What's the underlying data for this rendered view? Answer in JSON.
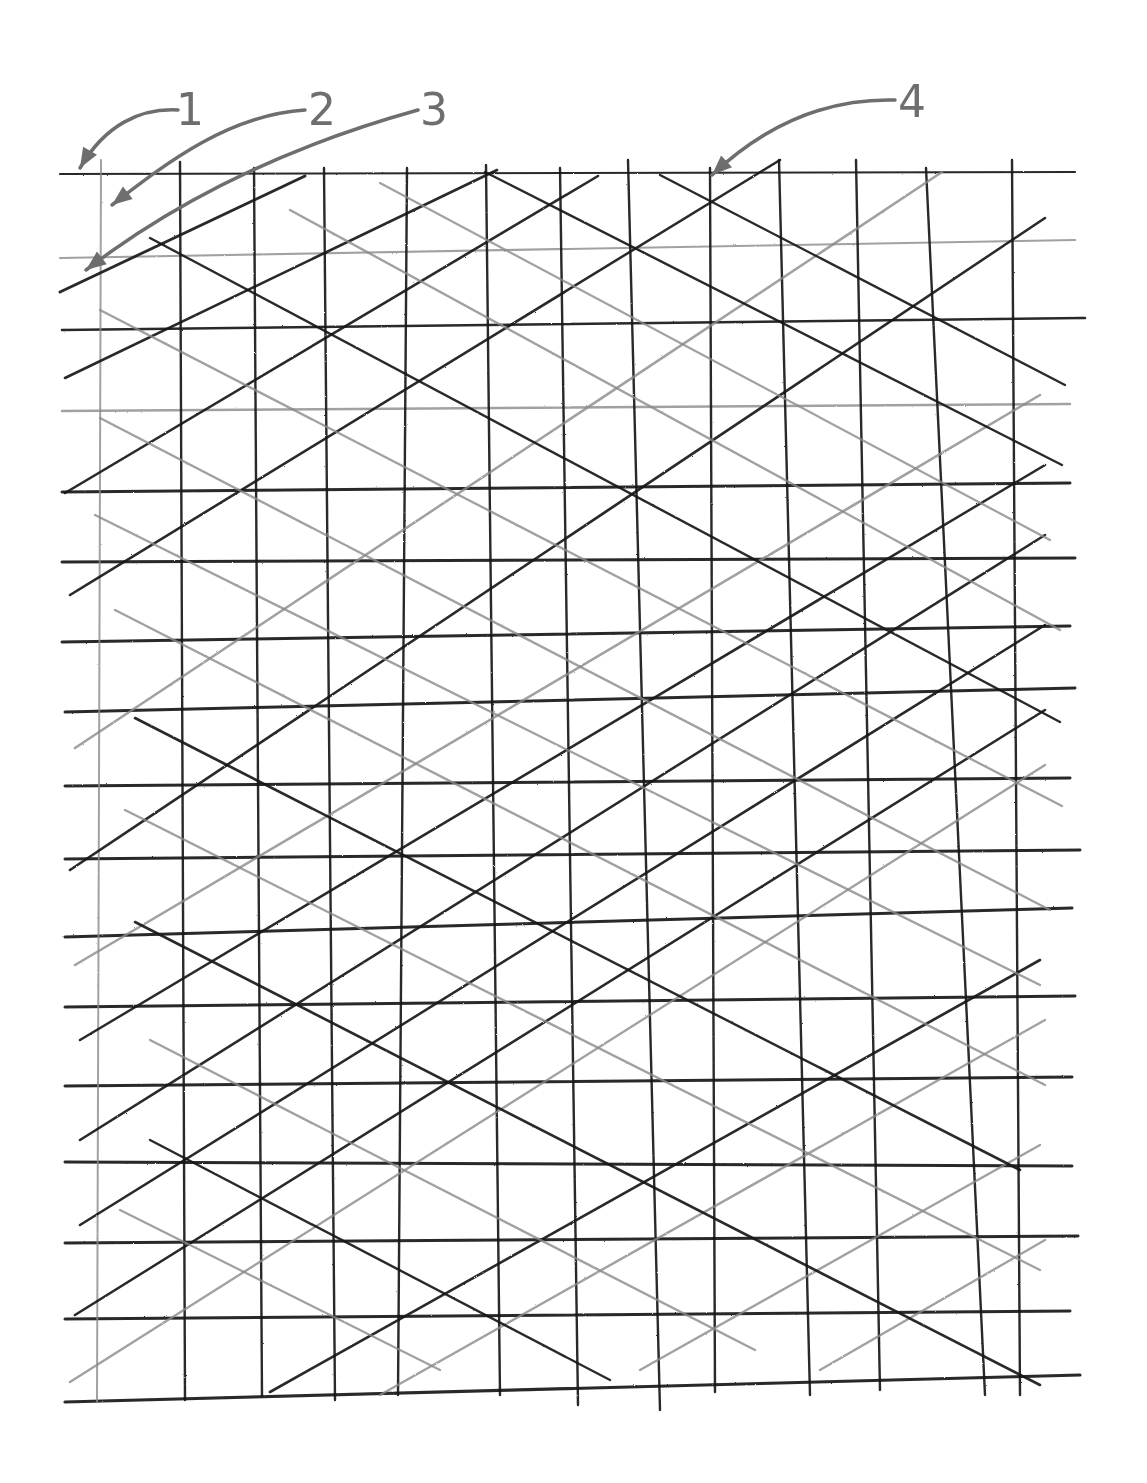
{
  "figure": {
    "type": "patent-style hand-drawn lattice / mesh diagram",
    "background": "#ffffff",
    "ink_dark": "#161616",
    "ink_gray": "#8a8a8a",
    "callout_color": "#6e6e6e"
  },
  "callouts": [
    {
      "id": "1",
      "label": "1",
      "label_x": 183,
      "label_y": 88,
      "path": "M178,110 C140,108 105,125 80,168",
      "tip": [
        76,
        172
      ]
    },
    {
      "id": "2",
      "label": "2",
      "label_x": 318,
      "label_y": 88,
      "path": "M305,110 C230,115 170,160 112,205",
      "tip": [
        106,
        210
      ]
    },
    {
      "id": "3",
      "label": "3",
      "label_x": 428,
      "label_y": 88,
      "path": "M418,110 C310,140 190,190 86,270",
      "tip": [
        80,
        276
      ]
    },
    {
      "id": "4",
      "label": "4",
      "label_x": 905,
      "label_y": 78,
      "path": "M895,100 C820,98 760,130 712,175",
      "tip": [
        708,
        180
      ]
    }
  ],
  "horizontal_lines": [
    {
      "y1": 174,
      "y2": 172,
      "x1": 60,
      "x2": 1075,
      "tone": "dark",
      "w": 2.2
    },
    {
      "y1": 258,
      "y2": 240,
      "x1": 60,
      "x2": 1075,
      "tone": "gray",
      "w": 2.2
    },
    {
      "y1": 330,
      "y2": 318,
      "x1": 62,
      "x2": 1085,
      "tone": "dark",
      "w": 2.6
    },
    {
      "y1": 411,
      "y2": 404,
      "x1": 62,
      "x2": 1070,
      "tone": "gray",
      "w": 2.4
    },
    {
      "y1": 492,
      "y2": 483,
      "x1": 62,
      "x2": 1070,
      "tone": "dark",
      "w": 3
    },
    {
      "y1": 562,
      "y2": 558,
      "x1": 62,
      "x2": 1075,
      "tone": "dark",
      "w": 3
    },
    {
      "y1": 642,
      "y2": 626,
      "x1": 62,
      "x2": 1070,
      "tone": "dark",
      "w": 3
    },
    {
      "y1": 712,
      "y2": 688,
      "x1": 65,
      "x2": 1075,
      "tone": "dark",
      "w": 3
    },
    {
      "y1": 786,
      "y2": 778,
      "x1": 65,
      "x2": 1070,
      "tone": "dark",
      "w": 3
    },
    {
      "y1": 859,
      "y2": 850,
      "x1": 65,
      "x2": 1080,
      "tone": "dark",
      "w": 3
    },
    {
      "y1": 937,
      "y2": 908,
      "x1": 65,
      "x2": 1072,
      "tone": "dark",
      "w": 3
    },
    {
      "y1": 1007,
      "y2": 996,
      "x1": 65,
      "x2": 1075,
      "tone": "dark",
      "w": 3
    },
    {
      "y1": 1086,
      "y2": 1077,
      "x1": 65,
      "x2": 1072,
      "tone": "dark",
      "w": 3
    },
    {
      "y1": 1162,
      "y2": 1166,
      "x1": 65,
      "x2": 1072,
      "tone": "dark",
      "w": 3
    },
    {
      "y1": 1243,
      "y2": 1236,
      "x1": 65,
      "x2": 1078,
      "tone": "dark",
      "w": 3
    },
    {
      "y1": 1319,
      "y2": 1311,
      "x1": 65,
      "x2": 1070,
      "tone": "dark",
      "w": 3
    },
    {
      "y1": 1402,
      "y2": 1375,
      "x1": 65,
      "x2": 1080,
      "tone": "dark",
      "w": 3.2
    }
  ],
  "vertical_lines": [
    {
      "x1": 101,
      "x2": 97,
      "y1": 160,
      "y2": 1402,
      "tone": "gray",
      "w": 2
    },
    {
      "x1": 180,
      "x2": 185,
      "y1": 162,
      "y2": 1400,
      "tone": "dark",
      "w": 2.4
    },
    {
      "x1": 254,
      "x2": 262,
      "y1": 168,
      "y2": 1396,
      "tone": "dark",
      "w": 2.4
    },
    {
      "x1": 324,
      "x2": 335,
      "y1": 168,
      "y2": 1400,
      "tone": "dark",
      "w": 2.4
    },
    {
      "x1": 407,
      "x2": 398,
      "y1": 168,
      "y2": 1395,
      "tone": "dark",
      "w": 2.4
    },
    {
      "x1": 486,
      "x2": 500,
      "y1": 165,
      "y2": 1395,
      "tone": "dark",
      "w": 2.4
    },
    {
      "x1": 560,
      "x2": 578,
      "y1": 168,
      "y2": 1405,
      "tone": "dark",
      "w": 2.4
    },
    {
      "x1": 628,
      "x2": 660,
      "y1": 160,
      "y2": 1410,
      "tone": "dark",
      "w": 2.4
    },
    {
      "x1": 710,
      "x2": 715,
      "y1": 168,
      "y2": 1392,
      "tone": "dark",
      "w": 2.4
    },
    {
      "x1": 779,
      "x2": 810,
      "y1": 160,
      "y2": 1395,
      "tone": "dark",
      "w": 2.4
    },
    {
      "x1": 856,
      "x2": 880,
      "y1": 160,
      "y2": 1390,
      "tone": "dark",
      "w": 2.4
    },
    {
      "x1": 926,
      "x2": 985,
      "y1": 168,
      "y2": 1395,
      "tone": "dark",
      "w": 2.4
    },
    {
      "x1": 1012,
      "x2": 1020,
      "y1": 160,
      "y2": 1395,
      "tone": "dark",
      "w": 2.4
    }
  ],
  "rising_diagonals": [
    {
      "x1": 60,
      "y1": 292,
      "x2": 305,
      "y2": 176,
      "tone": "dark",
      "w": 3
    },
    {
      "x1": 65,
      "y1": 378,
      "x2": 497,
      "y2": 170,
      "tone": "dark",
      "w": 2.6
    },
    {
      "x1": 65,
      "y1": 493,
      "x2": 598,
      "y2": 176,
      "tone": "dark",
      "w": 2.6
    },
    {
      "x1": 70,
      "y1": 595,
      "x2": 780,
      "y2": 160,
      "tone": "dark",
      "w": 2.6
    },
    {
      "x1": 75,
      "y1": 748,
      "x2": 942,
      "y2": 172,
      "tone": "gray",
      "w": 2.6
    },
    {
      "x1": 70,
      "y1": 870,
      "x2": 1045,
      "y2": 218,
      "tone": "dark",
      "w": 2.6
    },
    {
      "x1": 75,
      "y1": 965,
      "x2": 1040,
      "y2": 395,
      "tone": "gray",
      "w": 2.6
    },
    {
      "x1": 80,
      "y1": 1040,
      "x2": 1045,
      "y2": 465,
      "tone": "dark",
      "w": 2.6
    },
    {
      "x1": 80,
      "y1": 1140,
      "x2": 1045,
      "y2": 535,
      "tone": "dark",
      "w": 2.6
    },
    {
      "x1": 80,
      "y1": 1225,
      "x2": 1045,
      "y2": 625,
      "tone": "dark",
      "w": 2.6
    },
    {
      "x1": 75,
      "y1": 1315,
      "x2": 1045,
      "y2": 710,
      "tone": "dark",
      "w": 2.6
    },
    {
      "x1": 70,
      "y1": 1382,
      "x2": 1045,
      "y2": 765,
      "tone": "gray",
      "w": 2.4
    },
    {
      "x1": 270,
      "y1": 1392,
      "x2": 1040,
      "y2": 960,
      "tone": "dark",
      "w": 2.6
    },
    {
      "x1": 380,
      "y1": 1395,
      "x2": 1045,
      "y2": 1020,
      "tone": "gray",
      "w": 2.4
    },
    {
      "x1": 640,
      "y1": 1370,
      "x2": 1040,
      "y2": 1145,
      "tone": "gray",
      "w": 2.4
    },
    {
      "x1": 820,
      "y1": 1370,
      "x2": 1045,
      "y2": 1240,
      "tone": "gray",
      "w": 2.4
    },
    {
      "x1": 380,
      "y1": 185,
      "x2": 770,
      "y2": 168,
      "tone": "none",
      "w": 0
    }
  ],
  "falling_diagonals": [
    {
      "x1": 150,
      "y1": 238,
      "x2": 1060,
      "y2": 722,
      "tone": "dark",
      "w": 2.4
    },
    {
      "x1": 100,
      "y1": 310,
      "x2": 1062,
      "y2": 806,
      "tone": "gray",
      "w": 2.4
    },
    {
      "x1": 290,
      "y1": 210,
      "x2": 1060,
      "y2": 630,
      "tone": "gray",
      "w": 2.4
    },
    {
      "x1": 380,
      "y1": 183,
      "x2": 1050,
      "y2": 540,
      "tone": "gray",
      "w": 2.2
    },
    {
      "x1": 660,
      "y1": 175,
      "x2": 1065,
      "y2": 385,
      "tone": "dark",
      "w": 2.4
    },
    {
      "x1": 485,
      "y1": 172,
      "x2": 1062,
      "y2": 465,
      "tone": "dark",
      "w": 2.4
    },
    {
      "x1": 100,
      "y1": 418,
      "x2": 1050,
      "y2": 910,
      "tone": "gray",
      "w": 2.4
    },
    {
      "x1": 95,
      "y1": 515,
      "x2": 1040,
      "y2": 985,
      "tone": "gray",
      "w": 2.4
    },
    {
      "x1": 115,
      "y1": 610,
      "x2": 1045,
      "y2": 1085,
      "tone": "gray",
      "w": 2.4
    },
    {
      "x1": 135,
      "y1": 718,
      "x2": 1020,
      "y2": 1170,
      "tone": "dark",
      "w": 2.6
    },
    {
      "x1": 125,
      "y1": 810,
      "x2": 1040,
      "y2": 1270,
      "tone": "gray",
      "w": 2.4
    },
    {
      "x1": 135,
      "y1": 922,
      "x2": 1040,
      "y2": 1385,
      "tone": "dark",
      "w": 2.6
    },
    {
      "x1": 150,
      "y1": 1040,
      "x2": 755,
      "y2": 1350,
      "tone": "gray",
      "w": 2.4
    },
    {
      "x1": 150,
      "y1": 1140,
      "x2": 610,
      "y2": 1380,
      "tone": "dark",
      "w": 2.4
    },
    {
      "x1": 120,
      "y1": 1210,
      "x2": 440,
      "y2": 1370,
      "tone": "gray",
      "w": 2.2
    }
  ]
}
